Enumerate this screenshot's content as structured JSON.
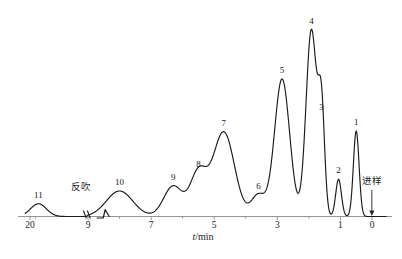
{
  "figure": {
    "kind": "chromatogram",
    "width": 402,
    "height": 259,
    "background": "#ffffff",
    "trace_color": "#1a1a1a",
    "axis_color": "#8a8a8a"
  },
  "axis": {
    "title_symbol": "t",
    "title_unit": "/min",
    "title_full": "t/min",
    "reversed": true,
    "tick_labels": [
      "20",
      "9",
      "7",
      "5",
      "3",
      "1",
      "0"
    ],
    "labeled_ticks": [
      20,
      9,
      7,
      5,
      3,
      1,
      0
    ],
    "minor_ticks": [
      19,
      8,
      6,
      4,
      2
    ],
    "break_position": 9.6,
    "break_label": "axis-break"
  },
  "annotations": [
    {
      "name": "backflush",
      "text": "反吹",
      "x_min": 10.4,
      "kind": "text"
    },
    {
      "name": "injection",
      "text": "进样",
      "x_min": 0.1,
      "kind": "text-with-arrow"
    }
  ],
  "chart_data": {
    "type": "line",
    "title": "",
    "xlabel": "t/min",
    "ylabel": "",
    "xlim": [
      21.0,
      -0.6
    ],
    "ylim": [
      0,
      100
    ],
    "x_axis_reversed": true,
    "grid": false,
    "legend": "none",
    "series": [
      {
        "name": "detector-signal",
        "peaks": [
          {
            "id": "11",
            "label": "11",
            "retention_min": 18.4,
            "height": 6.5,
            "width_min": 1.5,
            "shape": "broad"
          },
          {
            "id": "10",
            "label": "10",
            "retention_min": 8.0,
            "height": 13.0,
            "width_min": 0.42,
            "shape": "gaussian"
          },
          {
            "id": "9",
            "label": "9",
            "retention_min": 6.3,
            "height": 15.5,
            "width_min": 0.3,
            "shape": "gaussian"
          },
          {
            "id": "8",
            "label": "8",
            "retention_min": 5.5,
            "height": 22.0,
            "width_min": 0.26,
            "shape": "gaussian"
          },
          {
            "id": "7",
            "label": "7",
            "retention_min": 4.7,
            "height": 43.0,
            "width_min": 0.34,
            "shape": "gaussian"
          },
          {
            "id": "6",
            "label": "6",
            "retention_min": 3.6,
            "height": 11.0,
            "width_min": 0.22,
            "shape": "gaussian"
          },
          {
            "id": "5",
            "label": "5",
            "retention_min": 2.85,
            "height": 70.0,
            "width_min": 0.24,
            "shape": "gaussian"
          },
          {
            "id": "4",
            "label": "4",
            "retention_min": 1.92,
            "height": 95.0,
            "width_min": 0.17,
            "shape": "sharp"
          },
          {
            "id": "3",
            "label": "3",
            "retention_min": 1.6,
            "height": 51.0,
            "width_min": 0.1,
            "shape": "sharp"
          },
          {
            "id": "2",
            "label": "2",
            "retention_min": 1.06,
            "height": 19.0,
            "width_min": 0.09,
            "shape": "sharp"
          },
          {
            "id": "1",
            "label": "1",
            "retention_min": 0.5,
            "height": 43.5,
            "width_min": 0.09,
            "shape": "sharp"
          }
        ],
        "baseline": 0
      }
    ]
  }
}
